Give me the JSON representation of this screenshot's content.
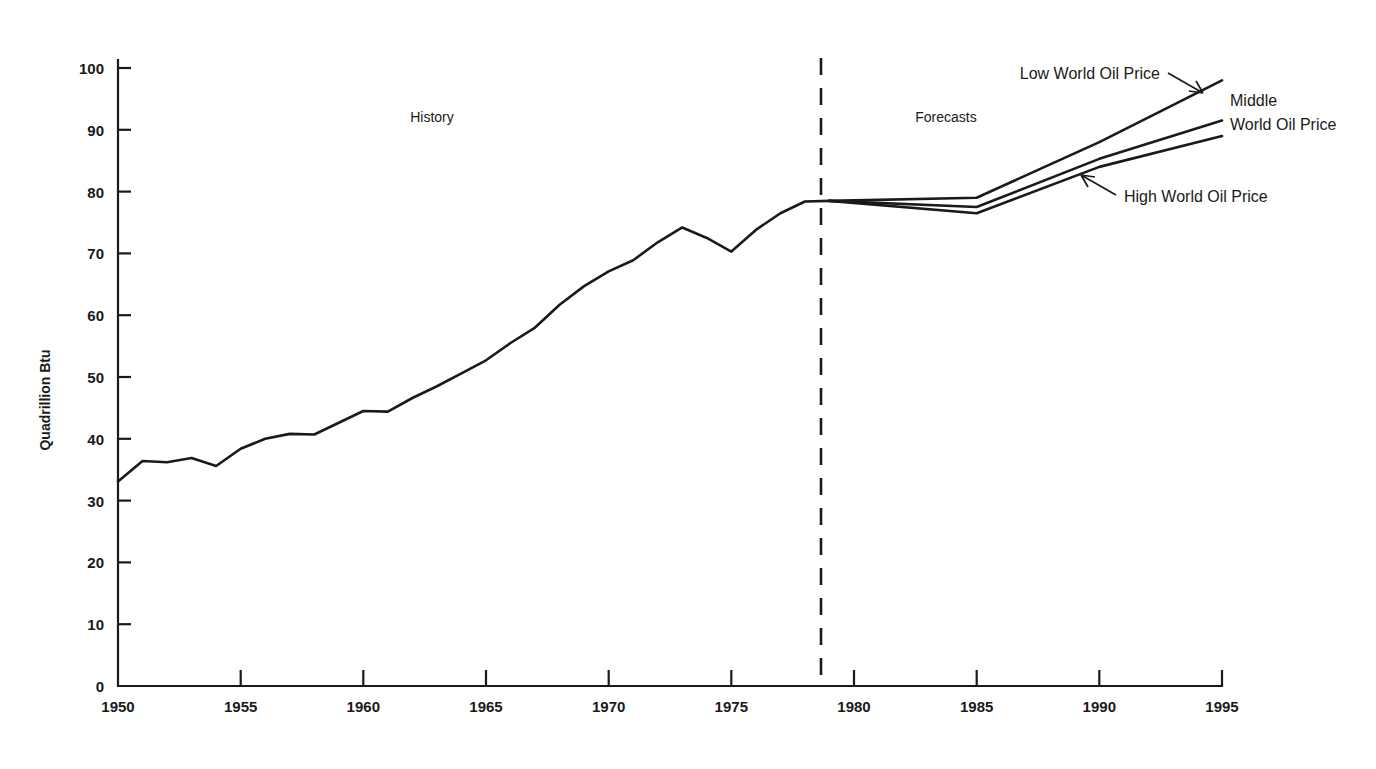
{
  "chart_data": {
    "type": "line",
    "title": "",
    "subtitle": "",
    "xlabel": "",
    "ylabel": "Quadrillion Btu",
    "xlim": [
      1950,
      1995
    ],
    "ylim": [
      0,
      100
    ],
    "xticks": [
      1950,
      1955,
      1960,
      1965,
      1970,
      1975,
      1980,
      1985,
      1990,
      1995
    ],
    "xtick_labels": [
      "1950",
      "1955",
      "1960",
      "1965",
      "1970",
      "1975",
      "1980",
      "1985",
      "1990",
      "1995"
    ],
    "yticks": [
      0,
      10,
      20,
      30,
      40,
      50,
      60,
      70,
      80,
      90,
      100
    ],
    "ytick_labels": [
      "0",
      "10",
      "20",
      "30",
      "40",
      "50",
      "60",
      "70",
      "80",
      "90",
      "100"
    ],
    "grid": false,
    "legend_position": "inline-annotations",
    "line_color": "#1a1a1a",
    "background_color": "#ffffff",
    "series": [
      {
        "name": "History",
        "x": [
          1950,
          1951,
          1952,
          1953,
          1954,
          1955,
          1956,
          1957,
          1958,
          1959,
          1960,
          1961,
          1962,
          1963,
          1964,
          1965,
          1966,
          1967,
          1968,
          1969,
          1970,
          1971,
          1972,
          1973,
          1974,
          1975,
          1976,
          1977,
          1978,
          1979
        ],
        "values": [
          33.1,
          36.4,
          36.2,
          36.9,
          35.6,
          38.4,
          40.0,
          40.8,
          40.7,
          42.6,
          44.5,
          44.4,
          46.6,
          48.5,
          50.6,
          52.7,
          55.5,
          58.0,
          61.7,
          64.7,
          67.1,
          68.9,
          71.8,
          74.2,
          72.5,
          70.3,
          73.8,
          76.5,
          78.4,
          78.5
        ]
      },
      {
        "name": "Low World Oil Price",
        "x": [
          1979,
          1985,
          1990,
          1995
        ],
        "values": [
          78.5,
          79.0,
          88.0,
          98.0
        ]
      },
      {
        "name": "Middle World Oil Price",
        "x": [
          1979,
          1985,
          1990,
          1995
        ],
        "values": [
          78.5,
          77.5,
          85.3,
          91.5
        ]
      },
      {
        "name": "High World Oil Price",
        "x": [
          1979,
          1985,
          1990,
          1995
        ],
        "values": [
          78.5,
          76.5,
          84.0,
          89.0
        ]
      }
    ],
    "divider": {
      "x": 1979,
      "style": "dashed",
      "left_label": "History",
      "right_label": "Forecasts"
    },
    "annotations": [
      {
        "id": "low-world-oil-price",
        "text": "Low World Oil Price",
        "series": "Low World Oil Price",
        "has_leader": true
      },
      {
        "id": "middle-world-oil-price",
        "text_line1": "Middle",
        "text_line2": "World Oil Price",
        "series": "Middle World Oil Price",
        "has_leader": false
      },
      {
        "id": "high-world-oil-price",
        "text": "High World Oil Price",
        "series": "High World Oil Price",
        "has_leader": true
      }
    ]
  }
}
